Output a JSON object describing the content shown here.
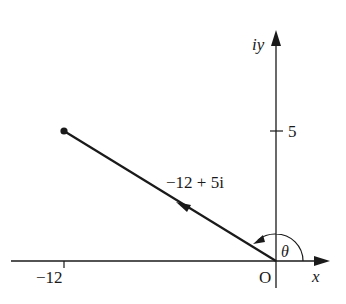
{
  "diagram": {
    "type": "argand-diagram",
    "axes": {
      "x_label": "x",
      "y_label": "iy",
      "origin_label": "O"
    },
    "ticks": {
      "x_tick_label": "−12",
      "y_tick_label": "5"
    },
    "vector": {
      "label": "−12 + 5i",
      "real": -12,
      "imag": 5,
      "endpoint": "dot"
    },
    "angle": {
      "label": "θ"
    },
    "colors": {
      "line": "#1a1a1a",
      "background": "#ffffff"
    }
  }
}
